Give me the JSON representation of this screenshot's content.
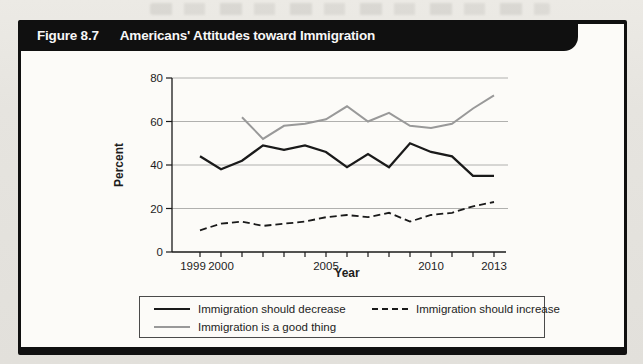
{
  "figure": {
    "label": "Figure 8.7",
    "title": "Americans' Attitudes toward Immigration"
  },
  "chart_data": {
    "type": "line",
    "title": "Americans' Attitudes toward Immigration",
    "x": [
      1999,
      2000,
      2001,
      2002,
      2003,
      2004,
      2005,
      2006,
      2007,
      2008,
      2009,
      2010,
      2011,
      2012,
      2013
    ],
    "xlabel": "Year",
    "ylabel": "Percent",
    "ylim": [
      0,
      80
    ],
    "yticks": [
      0,
      20,
      40,
      60,
      80
    ],
    "xtick_labels": [
      "1999",
      "2000",
      "2005",
      "2010",
      "2013"
    ],
    "grid": "horizontal",
    "legend_position": "bottom-box",
    "series": [
      {
        "name": "Immigration should decrease",
        "line": "solid",
        "color": "#1a1a1a",
        "values": [
          44,
          38,
          42,
          49,
          47,
          49,
          46,
          39,
          45,
          39,
          50,
          46,
          44,
          35,
          35
        ]
      },
      {
        "name": "Immigration is a good thing",
        "line": "solid",
        "color": "#999999",
        "values": [
          null,
          null,
          62,
          52,
          58,
          59,
          61,
          67,
          60,
          64,
          58,
          57,
          59,
          66,
          72
        ]
      },
      {
        "name": "Immigration should increase",
        "line": "dashed",
        "color": "#1a1a1a",
        "values": [
          10,
          13,
          14,
          12,
          13,
          14,
          16,
          17,
          16,
          18,
          14,
          17,
          18,
          21,
          23
        ]
      }
    ]
  },
  "legend": {
    "items": [
      {
        "label": "Immigration should decrease",
        "line": "solid",
        "color": "#1a1a1a"
      },
      {
        "label": "Immigration should increase",
        "line": "dashed",
        "color": "#1a1a1a"
      },
      {
        "label": "Immigration is a good thing",
        "line": "solid",
        "color": "#999999"
      }
    ]
  },
  "colors": {
    "header_bar": "#101010",
    "header_text": "#f7f7f7",
    "paper": "#e6e4df",
    "panel": "#fcfbf8",
    "grid": "#b0b0ae",
    "axis": "#1a1a1a"
  }
}
